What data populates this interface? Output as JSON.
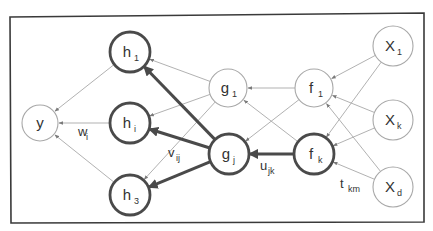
{
  "diagram": {
    "type": "neural-network",
    "frame": {
      "x1": 11,
      "y1": 16,
      "x2": 424,
      "y2": 222
    },
    "colors": {
      "thin_stroke": "#a8a8a8",
      "thick_stroke": "#4a4a4a",
      "text": "#333333",
      "frame": "#3a3a3a"
    },
    "nodes": [
      {
        "id": "y",
        "base": "y",
        "sub": "",
        "cx": 40,
        "cy": 123,
        "r": 18,
        "bold": false
      },
      {
        "id": "h1",
        "base": "h",
        "sub": "1",
        "cx": 130,
        "cy": 52,
        "r": 20,
        "bold": true
      },
      {
        "id": "hi",
        "base": "h",
        "sub": "i",
        "cx": 130,
        "cy": 123,
        "r": 20,
        "bold": true
      },
      {
        "id": "h3",
        "base": "h",
        "sub": "3",
        "cx": 130,
        "cy": 195,
        "r": 20,
        "bold": true
      },
      {
        "id": "g1",
        "base": "g",
        "sub": "1",
        "cx": 228,
        "cy": 88,
        "r": 19,
        "bold": false
      },
      {
        "id": "gj",
        "base": "g",
        "sub": "j",
        "cx": 229,
        "cy": 154,
        "r": 20,
        "bold": true
      },
      {
        "id": "f1",
        "base": "f",
        "sub": "1",
        "cx": 314,
        "cy": 88,
        "r": 19,
        "bold": false
      },
      {
        "id": "fk",
        "base": "f",
        "sub": "k",
        "cx": 314,
        "cy": 154,
        "r": 20,
        "bold": true
      },
      {
        "id": "X1",
        "base": "X",
        "sub": "1",
        "cx": 393,
        "cy": 46,
        "r": 20,
        "bold": false
      },
      {
        "id": "Xk",
        "base": "X",
        "sub": "k",
        "cx": 393,
        "cy": 120,
        "r": 20,
        "bold": false
      },
      {
        "id": "Xd",
        "base": "X",
        "sub": "d",
        "cx": 393,
        "cy": 187,
        "r": 20,
        "bold": false
      }
    ],
    "edges": [
      {
        "from": "h1",
        "to": "y",
        "bold": false
      },
      {
        "from": "hi",
        "to": "y",
        "bold": false
      },
      {
        "from": "h3",
        "to": "y",
        "bold": false
      },
      {
        "from": "g1",
        "to": "h1",
        "bold": false
      },
      {
        "from": "g1",
        "to": "hi",
        "bold": false
      },
      {
        "from": "g1",
        "to": "h3",
        "bold": false
      },
      {
        "from": "gj",
        "to": "h1",
        "bold": true
      },
      {
        "from": "gj",
        "to": "hi",
        "bold": true
      },
      {
        "from": "gj",
        "to": "h3",
        "bold": true
      },
      {
        "from": "f1",
        "to": "g1",
        "bold": false
      },
      {
        "from": "f1",
        "to": "gj",
        "bold": false
      },
      {
        "from": "fk",
        "to": "g1",
        "bold": false
      },
      {
        "from": "fk",
        "to": "gj",
        "bold": true
      },
      {
        "from": "X1",
        "to": "f1",
        "bold": false
      },
      {
        "from": "X1",
        "to": "fk",
        "bold": false
      },
      {
        "from": "Xk",
        "to": "f1",
        "bold": false
      },
      {
        "from": "Xk",
        "to": "fk",
        "bold": false
      },
      {
        "from": "Xd",
        "to": "f1",
        "bold": false
      },
      {
        "from": "Xd",
        "to": "fk",
        "bold": false
      }
    ],
    "edge_labels": [
      {
        "id": "wi",
        "base": "w",
        "sub": "i",
        "x": 78,
        "y": 136
      },
      {
        "id": "vij",
        "base": "v",
        "sub": "ij",
        "x": 168,
        "y": 157
      },
      {
        "id": "ujk",
        "base": "u",
        "sub": "jk",
        "x": 260,
        "y": 170
      },
      {
        "id": "tkm",
        "base": "t",
        "sub": "km",
        "x": 340,
        "y": 188
      }
    ]
  }
}
